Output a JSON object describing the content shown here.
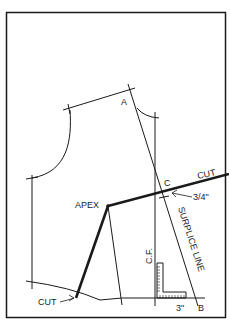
{
  "diagram": {
    "colors": {
      "background": "#ffffff",
      "line": "#1a1a1a"
    },
    "labels": {
      "point_a": "A",
      "point_b": "B",
      "point_c": "C",
      "apex": "APEX",
      "cut_top": "CUT",
      "cut_bottom": "CUT",
      "center_front": "C.F.",
      "surplice_line": "SURPLICE LINE",
      "measure_c": "3/4\"",
      "measure_b": "3\""
    }
  }
}
